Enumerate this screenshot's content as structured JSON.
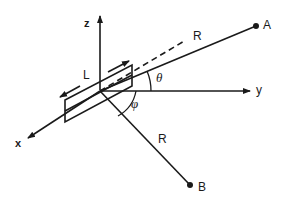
{
  "diagram": {
    "axes": {
      "x": "x",
      "y": "y",
      "z": "z"
    },
    "points": {
      "A": "A",
      "B": "B"
    },
    "labels": {
      "length": "L",
      "distance_A": "R",
      "distance_B": "R",
      "elevation_angle": "θ",
      "azimuth_angle": "φ"
    },
    "stroke_color": "#1a1a1a"
  }
}
